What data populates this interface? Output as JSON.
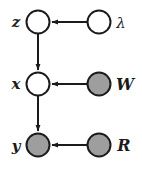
{
  "diagram": {
    "type": "probabilistic-graphical-model",
    "title": "",
    "background_color": "#ffffff",
    "stroke_color": "#1b1b1b",
    "observed_fill": "#9e9e9e",
    "latent_fill": "#ffffff",
    "nodes": [
      {
        "id": "z",
        "label": "z",
        "label_style": "bold-italic",
        "shape": "circle",
        "observed": false,
        "fill": "#ffffff",
        "cx": 38,
        "cy": 22,
        "r": 11.5,
        "label_x": 16,
        "label_y": 23,
        "label_anchor": "middle",
        "font_size": 15
      },
      {
        "id": "lambda",
        "label": "λ",
        "label_style": "italic-greek",
        "shape": "circle",
        "observed": false,
        "fill": "#ffffff",
        "cx": 99,
        "cy": 22,
        "r": 11.5,
        "label_x": 121,
        "label_y": 24,
        "label_anchor": "middle",
        "font_size": 15
      },
      {
        "id": "x",
        "label": "x",
        "label_style": "bold-italic",
        "shape": "circle",
        "observed": false,
        "fill": "#ffffff",
        "cx": 38,
        "cy": 84,
        "r": 11.5,
        "label_x": 16,
        "label_y": 85,
        "label_anchor": "middle",
        "font_size": 15
      },
      {
        "id": "W",
        "label": "W",
        "label_style": "bold-italic",
        "shape": "circle",
        "observed": true,
        "fill": "#9e9e9e",
        "cx": 99,
        "cy": 84,
        "r": 11.5,
        "label_x": 125,
        "label_y": 85,
        "label_anchor": "middle",
        "font_size": 16
      },
      {
        "id": "y",
        "label": "y",
        "label_style": "bold-italic",
        "shape": "circle",
        "observed": true,
        "fill": "#9e9e9e",
        "cx": 38,
        "cy": 145,
        "r": 11.5,
        "label_x": 16,
        "label_y": 147,
        "label_anchor": "middle",
        "font_size": 15
      },
      {
        "id": "R",
        "label": "R",
        "label_style": "bold-italic",
        "shape": "circle",
        "observed": true,
        "fill": "#9e9e9e",
        "cx": 99,
        "cy": 145,
        "r": 11.5,
        "label_x": 124,
        "label_y": 146,
        "label_anchor": "middle",
        "font_size": 16
      }
    ],
    "edges": [
      {
        "id": "lambda-to-z",
        "from": "lambda",
        "to": "z",
        "direction": "right-to-left",
        "x1": 87,
        "y1": 22,
        "x2": 52,
        "y2": 22
      },
      {
        "id": "z-to-x",
        "from": "z",
        "to": "x",
        "direction": "top-to-bottom",
        "x1": 38,
        "y1": 34,
        "x2": 38,
        "y2": 70
      },
      {
        "id": "W-to-x",
        "from": "W",
        "to": "x",
        "direction": "right-to-left",
        "x1": 87,
        "y1": 84,
        "x2": 52,
        "y2": 84
      },
      {
        "id": "x-to-y",
        "from": "x",
        "to": "y",
        "direction": "top-to-bottom",
        "x1": 38,
        "y1": 96,
        "x2": 38,
        "y2": 131
      },
      {
        "id": "R-to-y",
        "from": "R",
        "to": "y",
        "direction": "right-to-left",
        "x1": 87,
        "y1": 145,
        "x2": 52,
        "y2": 145
      }
    ]
  }
}
